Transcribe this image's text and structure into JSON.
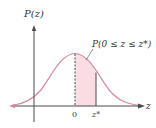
{
  "diagram": {
    "y_axis_label": "P(z)",
    "x_axis_label": "z",
    "area_label": "P(0 ≤ z ≤ z*)",
    "tick_zero": "0",
    "tick_zstar": "z*",
    "colors": {
      "curve": "#d9899b",
      "fill": "#f9dde3",
      "axis": "#4a4a4a",
      "text": "#333333"
    }
  }
}
